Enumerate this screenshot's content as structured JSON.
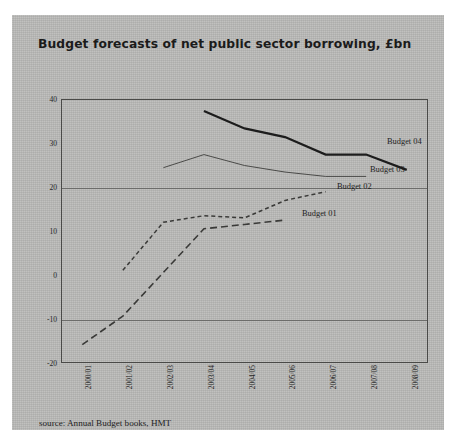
{
  "page": {
    "background_color": "#b9b9b7",
    "paper_color": "#ffffff"
  },
  "source_note": "source: Annual Budget books, HMT",
  "series_labels": {
    "budget04": "Budget 04",
    "budget03": "Budget 03",
    "budget02": "Budget 02",
    "budget01": "Budget 01"
  },
  "chart_data": {
    "type": "line",
    "title": "Budget forecasts of net public sector borrowing, £bn",
    "xlabel": "",
    "ylabel": "",
    "ylim": [
      -20,
      40
    ],
    "yticks": [
      40,
      30,
      20,
      10,
      0,
      -10,
      -20
    ],
    "ytick_labels": [
      "40",
      "30",
      "20",
      "10",
      "0",
      "-10",
      "-20"
    ],
    "gridlines_y": [
      20,
      -10
    ],
    "grid": "horizontal-partial",
    "legend_position": "inline-right-of-line-ends",
    "categories": [
      "2000/01",
      "2001/02",
      "2002/03",
      "2003/04",
      "2004/05",
      "2005/06",
      "2006/07",
      "2007/08",
      "2008/09"
    ],
    "series": [
      {
        "name": "Budget 01",
        "style": "long-dashed",
        "color": "#3a3a38",
        "x": [
          "2000/01",
          "2001/02",
          "2002/03",
          "2003/04",
          "2004/05",
          "2005/06"
        ],
        "values": [
          -16,
          -9.5,
          0.5,
          10.5,
          11.5,
          12.5
        ]
      },
      {
        "name": "Budget 02",
        "style": "short-dashed",
        "color": "#3a3a38",
        "x": [
          "2001/02",
          "2002/03",
          "2003/04",
          "2004/05",
          "2005/06",
          "2006/07"
        ],
        "values": [
          1,
          12,
          13.5,
          13,
          17,
          19
        ]
      },
      {
        "name": "Budget 03",
        "style": "thin-solid",
        "color": "#4a4a48",
        "x": [
          "2002/03",
          "2003/04",
          "2004/05",
          "2005/06",
          "2006/07",
          "2007/08"
        ],
        "values": [
          24.5,
          27.5,
          25,
          23.5,
          22.5,
          22.5
        ]
      },
      {
        "name": "Budget 04",
        "style": "thick-solid",
        "color": "#1c1c1c",
        "x": [
          "2003/04",
          "2004/05",
          "2005/06",
          "2006/07",
          "2007/08",
          "2008/09"
        ],
        "values": [
          37.5,
          33.5,
          31.5,
          27.5,
          27.5,
          24
        ]
      }
    ]
  }
}
